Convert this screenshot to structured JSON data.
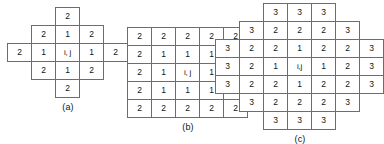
{
  "figures": [
    {
      "id": "figure-a",
      "name": "diamond-mask",
      "caption": "(a)",
      "rows": [
        [
          "",
          "",
          "2",
          "",
          ""
        ],
        [
          "",
          "2",
          "1",
          "2",
          ""
        ],
        [
          "2",
          "1",
          "i, j",
          "1",
          "2"
        ],
        [
          "",
          "2",
          "1",
          "2",
          ""
        ],
        [
          "",
          "",
          "2",
          "",
          ""
        ]
      ]
    },
    {
      "id": "figure-b",
      "name": "square-mask",
      "caption": "(b)",
      "rows": [
        [
          "2",
          "2",
          "2",
          "2",
          "2"
        ],
        [
          "2",
          "1",
          "1",
          "1",
          "2"
        ],
        [
          "2",
          "1",
          "i, j",
          "1",
          "2"
        ],
        [
          "2",
          "1",
          "1",
          "1",
          "2"
        ],
        [
          "2",
          "2",
          "2",
          "2",
          "2"
        ]
      ]
    },
    {
      "id": "figure-c",
      "name": "octagon-mask",
      "caption": "(c)",
      "rows": [
        [
          "",
          "",
          "3",
          "3",
          "3",
          "",
          ""
        ],
        [
          "",
          "3",
          "2",
          "2",
          "2",
          "3",
          ""
        ],
        [
          "3",
          "2",
          "2",
          "1",
          "2",
          "2",
          "3"
        ],
        [
          "3",
          "2",
          "1",
          "i,j",
          "1",
          "2",
          "3"
        ],
        [
          "3",
          "2",
          "2",
          "1",
          "2",
          "2",
          "3"
        ],
        [
          "",
          "3",
          "2",
          "2",
          "2",
          "3",
          ""
        ],
        [
          "",
          "",
          "3",
          "3",
          "3",
          "",
          ""
        ]
      ]
    }
  ],
  "style": {
    "border_color": "#6d6d6d",
    "text_color": "#141414",
    "background": "#ffffff"
  }
}
